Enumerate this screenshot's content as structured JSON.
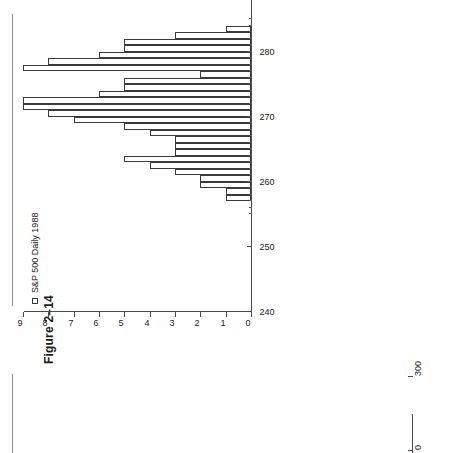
{
  "page": {
    "background_color": "#ffffff",
    "ink_color": "#1a1a1a",
    "orientation": "rotated-90-ccw"
  },
  "figure": {
    "title": "Figure 2–14",
    "legend_label": "S&P 500 Daily 1988",
    "legend_marker": "open-square-marker"
  },
  "bottom_figure": {
    "tick_label_300": "300",
    "tick_label_0": "0"
  },
  "chart_data": {
    "type": "bar",
    "orientation": "horizontal-rotated",
    "title": "Figure 2–14",
    "subtitle": "",
    "xlabel": "",
    "ylabel": "",
    "legend": [
      "S&P 500 Daily 1988"
    ],
    "legend_position": "top-left",
    "grid": false,
    "value_axis": {
      "name": "S&P 500 index level",
      "min": 240,
      "max": 300,
      "ticks": [
        240,
        250,
        260,
        270,
        280,
        290,
        300
      ],
      "tick_labels": [
        "240",
        "250",
        "260",
        "270",
        "280",
        "290",
        "300"
      ],
      "minor_ticks_range": [
        255,
        285
      ]
    },
    "freq_axis": {
      "name": "Frequency (days)",
      "min": 0,
      "max": 9,
      "ticks": [
        0,
        1,
        2,
        3,
        4,
        5,
        6,
        7,
        8,
        9
      ],
      "tick_labels": [
        "0",
        "1",
        "2",
        "3",
        "4",
        "5",
        "6",
        "7",
        "8",
        "9"
      ]
    },
    "bin_width": 1,
    "categories": [
      "257",
      "258",
      "259",
      "260",
      "261",
      "262",
      "263",
      "264",
      "265",
      "266",
      "267",
      "268",
      "269",
      "270",
      "271",
      "272",
      "273",
      "274",
      "275",
      "276",
      "277",
      "278",
      "279",
      "280",
      "281",
      "282",
      "283"
    ],
    "values": [
      1,
      1,
      2,
      2,
      3,
      4,
      5,
      3,
      3,
      3,
      4,
      5,
      7,
      8,
      9,
      9,
      6,
      5,
      5,
      2,
      9,
      8,
      6,
      5,
      5,
      3,
      1
    ],
    "series": [
      {
        "name": "S&P 500 Daily 1988",
        "values": [
          1,
          1,
          2,
          2,
          3,
          4,
          5,
          3,
          3,
          3,
          4,
          5,
          7,
          8,
          9,
          9,
          6,
          5,
          5,
          2,
          9,
          8,
          6,
          5,
          5,
          3,
          1
        ]
      }
    ]
  }
}
